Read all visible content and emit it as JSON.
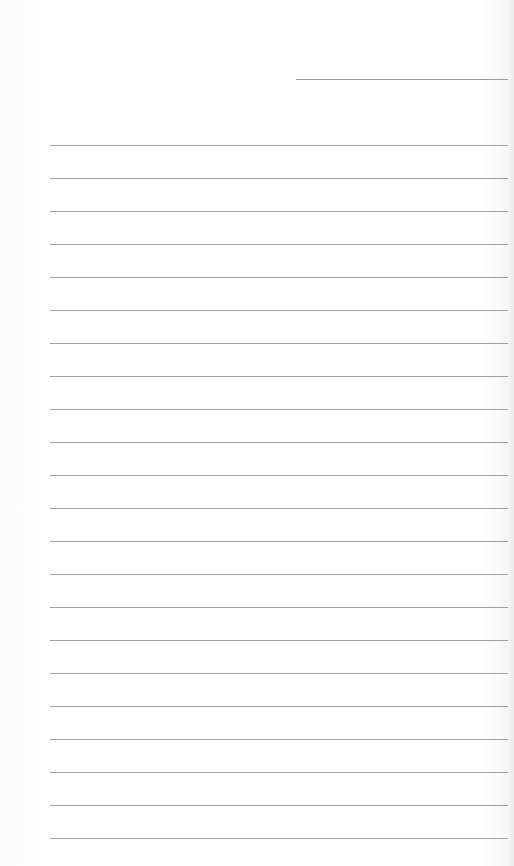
{
  "page": {
    "type": "lined-paper",
    "background_color": "#ffffff",
    "line_color": "#a0a0a0",
    "header_field": {
      "label": "",
      "value": ""
    },
    "ruled_line_count": 22,
    "line_spacing_px": 33,
    "lines": [
      "",
      "",
      "",
      "",
      "",
      "",
      "",
      "",
      "",
      "",
      "",
      "",
      "",
      "",
      "",
      "",
      "",
      "",
      "",
      "",
      "",
      ""
    ]
  }
}
